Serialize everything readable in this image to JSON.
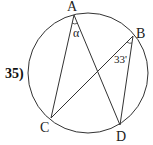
{
  "problem": {
    "number_label": "35)"
  },
  "diagram": {
    "stroke_color": "#333333",
    "circle": {
      "cx": 88,
      "cy": 73,
      "r": 60
    },
    "points": {
      "A": {
        "label": "A",
        "x": 74,
        "y": 15
      },
      "B": {
        "label": "B",
        "x": 133,
        "y": 36
      },
      "C": {
        "label": "C",
        "x": 51,
        "y": 118
      },
      "D": {
        "label": "D",
        "x": 120,
        "y": 125
      }
    },
    "segments": [
      "A-C",
      "A-D",
      "C-B",
      "B-D"
    ],
    "angles": {
      "at_A": {
        "label": "α",
        "between": "CAD"
      },
      "at_B": {
        "label": "33'",
        "between": "CBD"
      }
    }
  }
}
